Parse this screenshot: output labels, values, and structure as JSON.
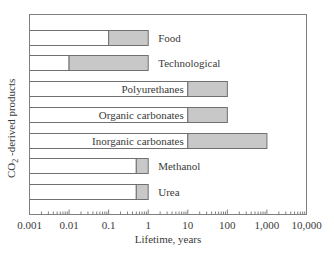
{
  "chart_data": {
    "type": "bar",
    "subtype": "floating-range-horizontal-log",
    "title": "",
    "xlabel": "Lifetime, years",
    "ylabel": "CO2-derived products",
    "ylabel_parts": {
      "pre": "CO",
      "sub": "2",
      "post": " -derived products"
    },
    "xscale": "log",
    "xlim": [
      0.001,
      10000
    ],
    "xticks": [
      0.001,
      0.01,
      0.1,
      1,
      10,
      100,
      1000,
      10000
    ],
    "xtick_labels": [
      "0.001",
      "0.01",
      "0.1",
      "1",
      "10",
      "100",
      "1,000",
      "10,000"
    ],
    "grid": false,
    "legend": null,
    "categories": [
      "Food",
      "Technological",
      "Polyurethanes",
      "Organic carbonates",
      "Inorganic carbonates",
      "Methanol",
      "Urea"
    ],
    "series": [
      {
        "name": "lifetime range (shaded)",
        "ranges": [
          [
            0.1,
            1
          ],
          [
            0.01,
            1
          ],
          [
            10,
            100
          ],
          [
            10,
            100
          ],
          [
            10,
            1000
          ],
          [
            0.5,
            1
          ],
          [
            0.5,
            1
          ]
        ]
      }
    ],
    "label_positions": [
      "right",
      "right",
      "left",
      "left",
      "left",
      "right",
      "right"
    ],
    "colors": {
      "shaded": "#c8c8c8",
      "outline": "#707070",
      "axis": "#808080",
      "text": "#3a3a3a"
    }
  }
}
